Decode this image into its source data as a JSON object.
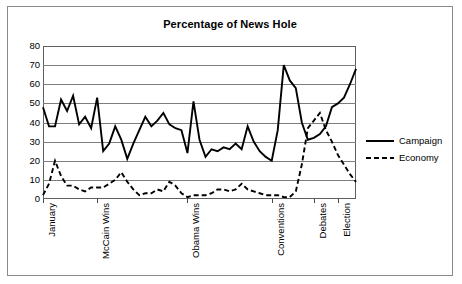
{
  "chart_data": {
    "type": "line",
    "title": "Percentage of News Hole",
    "xlabel": "",
    "ylabel": "",
    "ylim": [
      0,
      80
    ],
    "yticks": [
      0,
      10,
      20,
      30,
      40,
      50,
      60,
      70,
      80
    ],
    "grid": "horizontal",
    "legend_position": "right",
    "x_tick_labels": [
      "January",
      "McCain Wins",
      "Obama Wins",
      "Conventions",
      "Debates",
      "Election"
    ],
    "x_tick_indices": [
      0,
      9,
      24,
      38,
      45,
      49
    ],
    "n_points": 51,
    "series": [
      {
        "name": "Campaign",
        "style": "solid",
        "color": "#000000",
        "values": [
          48,
          38,
          38,
          52,
          46,
          54,
          39,
          43,
          37,
          53,
          25,
          29,
          38,
          31,
          21,
          29,
          36,
          43,
          38,
          41,
          45,
          39,
          37,
          36,
          24,
          51,
          31,
          22,
          26,
          25,
          27,
          26,
          29,
          26,
          38,
          30,
          25,
          22,
          20,
          36,
          70,
          62,
          58,
          40,
          31,
          32,
          34,
          38,
          48,
          50,
          53,
          60,
          68
        ]
      },
      {
        "name": "Economy",
        "style": "dashed",
        "color": "#000000",
        "values": [
          2,
          8,
          20,
          12,
          7,
          7,
          5,
          4,
          6,
          6,
          6,
          8,
          10,
          14,
          9,
          5,
          2,
          3,
          3,
          5,
          4,
          9,
          7,
          3,
          1,
          2,
          2,
          2,
          3,
          5,
          5,
          4,
          5,
          8,
          5,
          4,
          3,
          2,
          2,
          2,
          1,
          1,
          4,
          18,
          37,
          41,
          45,
          36,
          30,
          23,
          18,
          13,
          9
        ]
      }
    ]
  },
  "legend": {
    "items": [
      {
        "label": "Campaign",
        "style": "solid"
      },
      {
        "label": "Economy",
        "style": "dashed"
      }
    ]
  }
}
